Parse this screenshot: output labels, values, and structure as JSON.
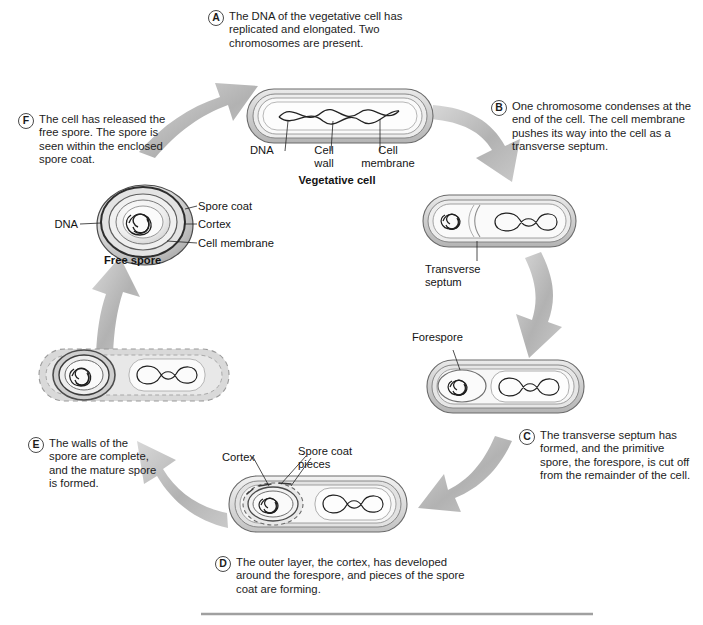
{
  "diagram": {
    "colors": {
      "arrow": "#b0b0b0",
      "arrow_light": "#d9d9d9",
      "cell_wall_fill": "#d2d2d2",
      "cell_membrane_fill": "#bdbdbd",
      "cytoplasm": "#f7f7f7",
      "outline": "#5a5a5a",
      "dna_stroke": "#1f1f1f",
      "rule": "#a0a0a0",
      "text": "#1a1a1a"
    }
  },
  "steps": [
    {
      "letter": "A",
      "text": "The DNA of the vegetative cell has replicated and elongated. Two chromosomes are present."
    },
    {
      "letter": "B",
      "text": "One chromosome condenses at the end of the cell. The cell membrane pushes its way into the cell as a transverse septum."
    },
    {
      "letter": "C",
      "text": "The transverse septum has formed, and the primitive spore, the forespore, is cut off from the remainder of the cell."
    },
    {
      "letter": "D",
      "text": "The outer layer, the cortex, has developed around the forespore, and pieces of the spore coat are forming."
    },
    {
      "letter": "E",
      "text": "The walls of the spore are complete, and the mature spore is formed."
    },
    {
      "letter": "F",
      "text": "The cell has released the free spore. The spore is seen within the enclosed spore coat."
    }
  ],
  "labels": {
    "stage_a": {
      "dna": "DNA",
      "cell_wall_line1": "Cell",
      "cell_wall_line2": "wall",
      "cell_membrane_line1": "Cell",
      "cell_membrane_line2": "membrane",
      "caption": "Vegetative cell"
    },
    "stage_b": {
      "transverse_septum_line1": "Transverse",
      "transverse_septum_line2": "septum"
    },
    "stage_c": {
      "forespore": "Forespore"
    },
    "stage_d": {
      "cortex": "Cortex",
      "spore_coat_pieces_line1": "Spore coat",
      "spore_coat_pieces_line2": "pieces"
    },
    "stage_f": {
      "dna": "DNA",
      "spore_coat": "Spore coat",
      "cortex": "Cortex",
      "cell_membrane": "Cell membrane",
      "caption": "Free spore"
    }
  }
}
